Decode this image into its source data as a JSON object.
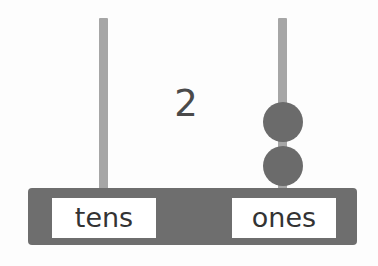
{
  "diagram": {
    "type": "place-value-abacus",
    "background_color": "#fdfdfd",
    "value_numeral": "2",
    "numeral_color": "#4a4a4a",
    "base_bar": {
      "name": "base-bar",
      "color": "#6e6e6e"
    },
    "rod_color": "#a6a6a6",
    "bead_color": "#6b6b6b",
    "columns": [
      {
        "id": "tens",
        "label": "tens",
        "bead_count": 0,
        "rod_name": "rod-tens"
      },
      {
        "id": "ones",
        "label": "ones",
        "bead_count": 2,
        "rod_name": "rod-ones"
      }
    ],
    "beads": [
      {
        "id": "bead-ones-1",
        "column": "ones",
        "index": 1
      },
      {
        "id": "bead-ones-2",
        "column": "ones",
        "index": 2
      }
    ]
  }
}
